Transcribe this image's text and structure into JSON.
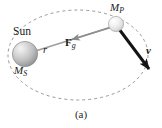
{
  "figure": {
    "caption": "(a)",
    "background_color": "#ffffff",
    "width": 162,
    "height": 128,
    "labels": {
      "sun": "Sun",
      "sun_mass": "M",
      "sun_mass_sub": "S",
      "planet_mass": "M",
      "planet_mass_sub": "P",
      "radius": "r",
      "force": "F",
      "force_sub": "g",
      "velocity": "v"
    },
    "orbit": {
      "type": "dashed-ellipse",
      "center_x": 78,
      "center_y": 55,
      "radius_x": 70,
      "radius_y": 45,
      "stroke_color": "#8d8d8d",
      "dash": "3 3",
      "stroke_width": 0.9
    },
    "sun_body": {
      "center_x": 25,
      "center_y": 54,
      "radius": 12.5,
      "fill_light": "#efefef",
      "fill_mid": "#c9c9c9",
      "fill_dark": "#8e8e8e",
      "edge_color": "#7a7a7a"
    },
    "planet_body": {
      "center_x": 116,
      "center_y": 24,
      "radius": 7.5,
      "fill_light": "#fbfbfb",
      "fill_mid": "#e8e8e8",
      "fill_dark": "#bdbdbd",
      "edge_color": "#999999"
    },
    "radius_line": {
      "x1": 26,
      "y1": 54,
      "x2": 112,
      "y2": 27,
      "stroke_color": "#9a9a9a",
      "stroke_width": 1.6
    },
    "force_arrow": {
      "label": "F_g",
      "from_x": 112,
      "from_y": 27,
      "to_x": 70,
      "to_y": 40,
      "direction": "toward-sun",
      "stroke_color": "#8e8e8e",
      "stroke_width": 1.6
    },
    "velocity_arrow": {
      "label": "v",
      "from_x": 119,
      "from_y": 29,
      "to_x": 151,
      "to_y": 72,
      "direction": "tangent-to-orbit",
      "stroke_color": "#141414",
      "stroke_width": 3.0
    }
  }
}
